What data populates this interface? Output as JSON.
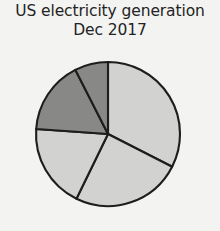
{
  "chart_data": {
    "type": "pie",
    "title": "US electricity generation Dec 2017",
    "title_lines": [
      "US electricity generation",
      "Dec 2017"
    ],
    "xlabel": "",
    "ylabel": "",
    "legend": "none",
    "grid": false,
    "start_angle_deg": 0,
    "direction": "clockwise",
    "center": {
      "x": 108,
      "y": 134
    },
    "radius": 72,
    "categories": [
      "Slice 1",
      "Slice 2",
      "Slice 3",
      "Slice 4",
      "Slice 5"
    ],
    "values": [
      32,
      25,
      19,
      16,
      8
    ],
    "slices": [
      {
        "label": "Slice 1",
        "value": 32,
        "start_deg": 0,
        "end_deg": 117,
        "color": "#d2d2d0",
        "shade": "light"
      },
      {
        "label": "Slice 2",
        "value": 25,
        "start_deg": 117,
        "end_deg": 206,
        "color": "#d2d2d0",
        "shade": "light"
      },
      {
        "label": "Slice 3",
        "value": 19,
        "start_deg": 206,
        "end_deg": 274,
        "color": "#d2d2d0",
        "shade": "light"
      },
      {
        "label": "Slice 4",
        "value": 16,
        "start_deg": 274,
        "end_deg": 333,
        "color": "#888886",
        "shade": "dark"
      },
      {
        "label": "Slice 5",
        "value": 8,
        "start_deg": 333,
        "end_deg": 360,
        "color": "#888886",
        "shade": "dark"
      }
    ],
    "colors": {
      "light_slice": "#d2d2d0",
      "dark_slice": "#888886",
      "outline": "#1d1d1d",
      "background": "#f3f3f2",
      "title_text": "#232323"
    }
  }
}
